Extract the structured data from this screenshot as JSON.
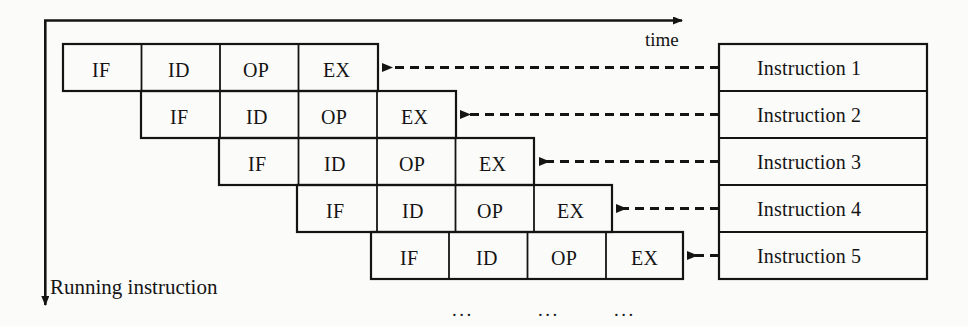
{
  "figure": {
    "background_color": "#fbfbfa",
    "line_color": "#141414"
  },
  "axes": {
    "time_label": "time",
    "running_label": "Running instruction",
    "time_axis_name": "time-axis-arrow",
    "running_axis_name": "running-instruction-axis-arrow"
  },
  "pipeline": {
    "stages": [
      "IF",
      "ID",
      "OP",
      "EX"
    ],
    "cell_width": 78,
    "cell_height": 47,
    "origin_x": 63,
    "origin_y": 44,
    "rows": [
      {
        "index": 1,
        "shift": 0,
        "cells": [
          "IF",
          "ID",
          "OP",
          "EX"
        ]
      },
      {
        "index": 2,
        "shift": 1,
        "cells": [
          "IF",
          "ID",
          "OP",
          "EX"
        ]
      },
      {
        "index": 3,
        "shift": 2,
        "cells": [
          "IF",
          "ID",
          "OP",
          "EX"
        ]
      },
      {
        "index": 4,
        "shift": 3,
        "cells": [
          "IF",
          "ID",
          "OP",
          "EX"
        ]
      },
      {
        "index": 5,
        "shift": 4,
        "cells": [
          "IF",
          "ID",
          "OP",
          "EX"
        ]
      }
    ]
  },
  "instructions": {
    "box_left": 719,
    "box_right": 927,
    "box_top": 44,
    "row_height": 47,
    "items": [
      {
        "label": "Instruction 1"
      },
      {
        "label": "Instruction 2"
      },
      {
        "label": "Instruction 3"
      },
      {
        "label": "Instruction 4"
      },
      {
        "label": "Instruction 5"
      }
    ]
  },
  "continuation": {
    "ellipsis": [
      "...",
      "...",
      "..."
    ],
    "y": 300,
    "x_positions": [
      452,
      538,
      614
    ]
  }
}
